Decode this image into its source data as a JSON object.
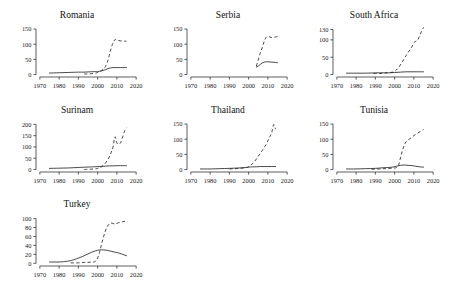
{
  "figure": {
    "layout": "small-multiples-grid",
    "rows": 3,
    "columns": 3,
    "panel_count": 7
  },
  "chart_data": [
    {
      "type": "line",
      "title": "Romania",
      "xlabel": "",
      "ylabel": "",
      "xlim": [
        1968,
        2022
      ],
      "ylim": [
        -8,
        160
      ],
      "xticks": [
        1970,
        1980,
        1990,
        2000,
        2010,
        2020
      ],
      "yticks": [
        0,
        50,
        100,
        150
      ],
      "grid": false,
      "legend": "none",
      "series": [
        {
          "name": "solid",
          "style": "solid",
          "x": [
            1975,
            1980,
            1985,
            1990,
            1993,
            1996,
            1999,
            2000,
            2001,
            2002,
            2003,
            2004,
            2005,
            2006,
            2007,
            2008,
            2010,
            2012,
            2015
          ],
          "values": [
            5,
            6,
            7,
            8,
            8,
            9,
            10,
            10,
            11,
            12,
            14,
            16,
            19,
            21,
            22,
            23,
            23,
            23,
            23
          ]
        },
        {
          "name": "dashed",
          "style": "dashed",
          "x": [
            1993,
            1995,
            1997,
            1999,
            2000,
            2001,
            2002,
            2003,
            2004,
            2005,
            2006,
            2007,
            2008,
            2009,
            2010,
            2012,
            2014,
            2015
          ],
          "values": [
            2,
            2,
            3,
            5,
            7,
            10,
            13,
            18,
            26,
            40,
            62,
            86,
            105,
            115,
            113,
            111,
            110,
            110
          ]
        }
      ]
    },
    {
      "type": "line",
      "title": "Serbia",
      "xlabel": "",
      "ylabel": "",
      "xlim": [
        1968,
        2022
      ],
      "ylim": [
        -8,
        160
      ],
      "xticks": [
        1970,
        1980,
        1990,
        2000,
        2010,
        2020
      ],
      "yticks": [
        0,
        50,
        100,
        150
      ],
      "grid": false,
      "legend": "none",
      "series": [
        {
          "name": "solid",
          "style": "solid",
          "x": [
            2004,
            2005,
            2006,
            2007,
            2008,
            2009,
            2010,
            2012,
            2014,
            2015
          ],
          "values": [
            25,
            28,
            33,
            38,
            41,
            42,
            42,
            41,
            40,
            39
          ]
        },
        {
          "name": "dashed",
          "style": "dashed",
          "x": [
            2004,
            2005,
            2006,
            2007,
            2008,
            2009,
            2010,
            2011,
            2012,
            2013,
            2014,
            2015
          ],
          "values": [
            28,
            48,
            70,
            88,
            108,
            122,
            126,
            124,
            122,
            122,
            124,
            125
          ]
        }
      ]
    },
    {
      "type": "line",
      "title": "South Africa",
      "xlabel": "",
      "ylabel": "",
      "xlim": [
        1968,
        2022
      ],
      "ylim": [
        -7,
        140
      ],
      "xticks": [
        1970,
        1980,
        1990,
        2000,
        2010,
        2020
      ],
      "yticks": [
        0,
        50,
        100,
        130
      ],
      "grid": false,
      "legend": "none",
      "series": [
        {
          "name": "solid",
          "style": "solid",
          "x": [
            1975,
            1980,
            1985,
            1990,
            1994,
            1997,
            2000,
            2003,
            2006,
            2009,
            2012,
            2015
          ],
          "values": [
            4,
            4,
            4,
            5,
            5,
            5,
            6,
            7,
            8,
            8,
            8,
            8
          ]
        },
        {
          "name": "dashed",
          "style": "dashed",
          "x": [
            1989,
            1992,
            1994,
            1996,
            1998,
            2000,
            2002,
            2004,
            2006,
            2008,
            2009,
            2010,
            2011,
            2012,
            2013,
            2014,
            2015
          ],
          "values": [
            3,
            3,
            4,
            5,
            6,
            9,
            20,
            37,
            55,
            72,
            80,
            92,
            96,
            100,
            112,
            125,
            136
          ]
        }
      ]
    },
    {
      "type": "line",
      "title": "Surinam",
      "xlabel": "",
      "ylabel": "",
      "xlim": [
        1968,
        2022
      ],
      "ylim": [
        -11,
        215
      ],
      "xticks": [
        1970,
        1980,
        1990,
        2000,
        2010,
        2020
      ],
      "yticks": [
        0,
        50,
        100,
        150,
        200
      ],
      "grid": false,
      "legend": "none",
      "series": [
        {
          "name": "solid",
          "style": "solid",
          "x": [
            1975,
            1980,
            1985,
            1990,
            1995,
            1998,
            2000,
            2002,
            2004,
            2006,
            2008,
            2010,
            2012,
            2015
          ],
          "values": [
            5,
            6,
            7,
            9,
            11,
            12,
            13,
            14,
            15,
            16,
            16,
            17,
            17,
            17
          ]
        },
        {
          "name": "dashed",
          "style": "dashed",
          "x": [
            1993,
            1995,
            1997,
            1999,
            2000,
            2001,
            2002,
            2004,
            2006,
            2007,
            2008,
            2009,
            2010,
            2011,
            2012,
            2013,
            2014,
            2015
          ],
          "values": [
            0,
            1,
            2,
            3,
            5,
            8,
            12,
            28,
            55,
            75,
            100,
            145,
            118,
            112,
            120,
            145,
            170,
            185
          ]
        }
      ]
    },
    {
      "type": "line",
      "title": "Thailand",
      "xlabel": "",
      "ylabel": "",
      "xlim": [
        1968,
        2022
      ],
      "ylim": [
        -8,
        160
      ],
      "xticks": [
        1970,
        1980,
        1990,
        2000,
        2010,
        2020
      ],
      "yticks": [
        0,
        50,
        100,
        150
      ],
      "grid": false,
      "legend": "none",
      "series": [
        {
          "name": "solid",
          "style": "solid",
          "x": [
            1975,
            1980,
            1985,
            1990,
            1994,
            1997,
            1999,
            2000,
            2002,
            2004,
            2006,
            2008,
            2010,
            2012,
            2014
          ],
          "values": [
            2,
            2,
            3,
            4,
            5,
            6,
            7,
            8,
            9,
            9,
            10,
            10,
            10,
            10,
            10
          ]
        },
        {
          "name": "dashed",
          "style": "dashed",
          "x": [
            1990,
            1993,
            1995,
            1997,
            1999,
            2000,
            2001,
            2003,
            2005,
            2007,
            2009,
            2010,
            2011,
            2012,
            2013,
            2014
          ],
          "values": [
            2,
            3,
            4,
            5,
            7,
            9,
            14,
            26,
            44,
            62,
            82,
            95,
            108,
            122,
            148,
            133
          ]
        }
      ]
    },
    {
      "type": "line",
      "title": "Tunisia",
      "xlabel": "",
      "ylabel": "",
      "xlim": [
        1968,
        2022
      ],
      "ylim": [
        -8,
        160
      ],
      "xticks": [
        1970,
        1980,
        1990,
        2000,
        2010,
        2020
      ],
      "yticks": [
        0,
        50,
        100,
        150
      ],
      "grid": false,
      "legend": "none",
      "series": [
        {
          "name": "solid",
          "style": "solid",
          "x": [
            1975,
            1980,
            1985,
            1990,
            1994,
            1997,
            1999,
            2001,
            2003,
            2005,
            2007,
            2009,
            2011,
            2013,
            2015
          ],
          "values": [
            2,
            2,
            3,
            4,
            6,
            7,
            8,
            11,
            14,
            15,
            14,
            13,
            11,
            9,
            8
          ]
        },
        {
          "name": "dashed",
          "style": "dashed",
          "x": [
            1988,
            1992,
            1995,
            1998,
            2000,
            2001,
            2002,
            2003,
            2004,
            2005,
            2006,
            2008,
            2010,
            2012,
            2014,
            2015
          ],
          "values": [
            1,
            2,
            3,
            4,
            5,
            7,
            14,
            38,
            62,
            80,
            92,
            102,
            112,
            120,
            128,
            132
          ]
        }
      ]
    },
    {
      "type": "line",
      "title": "Turkey",
      "xlabel": "",
      "ylabel": "",
      "xlim": [
        1968,
        2022
      ],
      "ylim": [
        -6,
        108
      ],
      "xticks": [
        1970,
        1980,
        1990,
        2000,
        2010,
        2020
      ],
      "yticks": [
        0,
        20,
        40,
        60,
        80,
        100
      ],
      "grid": false,
      "legend": "none",
      "series": [
        {
          "name": "solid",
          "style": "solid",
          "x": [
            1975,
            1980,
            1983,
            1986,
            1989,
            1992,
            1995,
            1997,
            1999,
            2001,
            2003,
            2005,
            2007,
            2009,
            2011,
            2013,
            2015
          ],
          "values": [
            3,
            3,
            4,
            6,
            10,
            15,
            21,
            25,
            28,
            30,
            30,
            29,
            27,
            25,
            23,
            20,
            17
          ]
        },
        {
          "name": "dashed",
          "style": "dashed",
          "x": [
            1986,
            1990,
            1993,
            1995,
            1997,
            1998,
            1999,
            2000,
            2001,
            2002,
            2003,
            2004,
            2005,
            2006,
            2007,
            2009,
            2011,
            2013,
            2015
          ],
          "values": [
            1,
            1,
            2,
            2,
            3,
            3,
            5,
            12,
            25,
            42,
            58,
            72,
            82,
            88,
            90,
            88,
            91,
            93,
            95
          ]
        }
      ]
    }
  ]
}
